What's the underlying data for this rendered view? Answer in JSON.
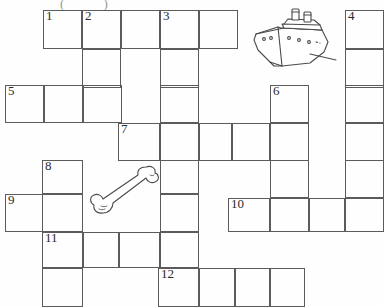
{
  "puzzle": {
    "type": "crossword-grid",
    "title_fragment": "( )",
    "cell_size": 39,
    "grid_color": "#5b5b5b",
    "background_color": "#fefefe",
    "number_color": "#2a2a2a",
    "numbers": {
      "n1": "1",
      "n2": "2",
      "n3": "3",
      "n4": "4",
      "n5": "5",
      "n6": "6",
      "n7": "7",
      "n8": "8",
      "n9": "9",
      "n10": "10",
      "n11": "11",
      "n12": "12"
    },
    "entries": [
      {
        "number": "1",
        "direction": "across",
        "length": 5,
        "row": 1,
        "col": 2
      },
      {
        "number": "2",
        "direction": "down",
        "length": 3,
        "row": 1,
        "col": 3
      },
      {
        "number": "3",
        "direction": "down",
        "length": 8,
        "row": 1,
        "col": 5
      },
      {
        "number": "4",
        "direction": "down",
        "length": 6,
        "row": 1,
        "col": 10
      },
      {
        "number": "5",
        "direction": "across",
        "length": 4,
        "row": 3,
        "col": 1
      },
      {
        "number": "6",
        "direction": "down",
        "length": 4,
        "row": 3,
        "col": 8
      },
      {
        "number": "7",
        "direction": "across",
        "length": 5,
        "row": 4,
        "col": 4
      },
      {
        "number": "8",
        "direction": "down",
        "length": 4,
        "row": 5,
        "col": 2
      },
      {
        "number": "9",
        "direction": "across",
        "length": 2,
        "row": 6,
        "col": 1
      },
      {
        "number": "10",
        "direction": "across",
        "length": 4,
        "row": 6,
        "col": 7
      },
      {
        "number": "11",
        "direction": "across",
        "length": 3,
        "row": 7,
        "col": 2
      },
      {
        "number": "12",
        "direction": "across",
        "length": 4,
        "row": 8,
        "col": 5
      }
    ],
    "illustrations": [
      {
        "name": "ship-illustration",
        "label": "ship",
        "x": 248,
        "y": 6,
        "width": 88,
        "height": 64
      },
      {
        "name": "bone-illustration",
        "label": "bone",
        "x": 83,
        "y": 163,
        "width": 78,
        "height": 58
      }
    ]
  }
}
